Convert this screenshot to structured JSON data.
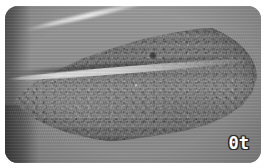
{
  "image": {
    "kind": "specimen-photograph",
    "subject": "leaf",
    "color_mode": "grayscale",
    "alt": "Grayscale close-up photograph of a single elongate obovate leaf lying on a plain gray background, with a pale midrib running from the narrow base at left to the broad rounded tip at right and a small dark blemish on the upper blade",
    "frame": {
      "corner_radius_px": 13,
      "margin_px": 5,
      "background_color": "#ffffff"
    },
    "palette": {
      "page_background": "#ffffff",
      "photo_background": "#8e8e8e",
      "leaf_mid_tone": "#747474",
      "leaf_dark_tone": "#636363",
      "leaf_light_tone": "#828282",
      "midrib_highlight": "#e8e8e8",
      "blemish_dark": "#141414",
      "label_fill": "#ffffff",
      "label_outline": "#2b2b2b"
    }
  },
  "overlay": {
    "corner_label": {
      "text": "0t",
      "position": "bottom-right",
      "style": "white blocky glyphs with dark outline"
    }
  },
  "features": [
    {
      "name": "leaf-blade",
      "description": "elongate obovate blade, mottled speckled surface"
    },
    {
      "name": "midrib",
      "description": "pale central vein from base at left to tip at right"
    },
    {
      "name": "leaf-base",
      "description": "narrow acute base at lower left"
    },
    {
      "name": "leaf-tip",
      "description": "broad rounded apex at right"
    },
    {
      "name": "blemish-spot",
      "description": "small dark spot on upper blade"
    },
    {
      "name": "left-shadow-band",
      "description": "dark vertical band along left edge of frame"
    }
  ]
}
